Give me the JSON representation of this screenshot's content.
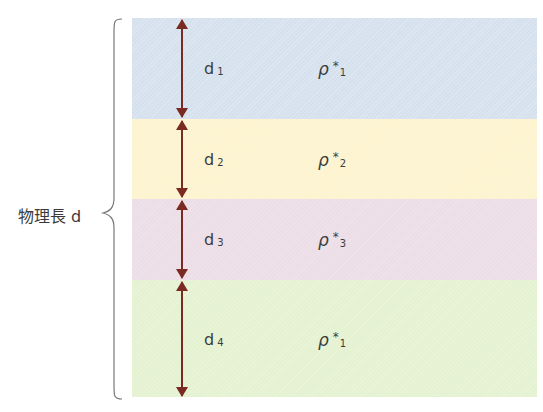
{
  "diagram": {
    "total_label": "物理長 d",
    "colors": {
      "arrow": "#7a2a22",
      "brace": "#777777"
    },
    "layers": [
      {
        "thickness_label": "d",
        "thickness_sub": "1",
        "density_label": "ρ",
        "density_star": "*",
        "density_sub": "1",
        "color": "#d6e1ee"
      },
      {
        "thickness_label": "d",
        "thickness_sub": "2",
        "density_label": "ρ",
        "density_star": "*",
        "density_sub": "2",
        "color": "#fdf3cf"
      },
      {
        "thickness_label": "d",
        "thickness_sub": "3",
        "density_label": "ρ",
        "density_star": "*",
        "density_sub": "3",
        "color": "#ecdde6"
      },
      {
        "thickness_label": "d",
        "thickness_sub": "4",
        "density_label": "ρ",
        "density_star": "*",
        "density_sub": "1",
        "color": "#e4f2d1"
      }
    ]
  }
}
